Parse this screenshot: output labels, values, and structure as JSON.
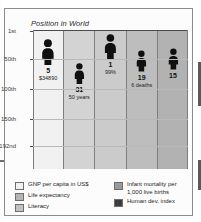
{
  "chart_data": {
    "type": "bar",
    "title": "Position in World",
    "xlabel": "",
    "ylabel": "",
    "ylim": [
      1,
      192
    ],
    "y_axis_inverted": true,
    "grid": true,
    "legend_position": "bottom",
    "y_ticks": [
      {
        "label": "1st",
        "value": 1
      },
      {
        "label": "50th",
        "value": 50
      },
      {
        "label": "100th",
        "value": 100
      },
      {
        "label": "150th",
        "value": 150
      },
      {
        "label": "192nd",
        "value": 192
      }
    ],
    "categories": [
      "GNP per capita in US$",
      "Life expectancy",
      "Literacy",
      "Infant mortality per 1,000 live births",
      "Human dev. index"
    ],
    "values": [
      5,
      31,
      1,
      19,
      15
    ],
    "annotations": [
      "$34890",
      "50 years",
      "99%",
      "6 deaths",
      ""
    ]
  },
  "chart": {
    "title": "Position in World",
    "yticks": [
      {
        "label": "1st",
        "top_px": 22
      },
      {
        "label": "50th",
        "top_px": 50
      },
      {
        "label": "100th",
        "top_px": 80
      },
      {
        "label": "150th",
        "top_px": 110
      },
      {
        "label": "192nd",
        "top_px": 137
      }
    ],
    "columns": [
      {
        "name": "gnp-per-capita",
        "rank": "5",
        "sublabel": "$34890",
        "fill": "#f1f1f1",
        "marker_top_px": 9,
        "person_height_px": 26,
        "person_color": "#101010"
      },
      {
        "name": "life-expectancy",
        "rank": "31",
        "sublabel": "50\nyears",
        "fill": "#d3d3d3",
        "marker_top_px": 33,
        "person_height_px": 21,
        "person_color": "#101010"
      },
      {
        "name": "literacy",
        "rank": "1",
        "sublabel": "99%",
        "fill": "#cbcbcb",
        "marker_top_px": 4,
        "person_height_px": 25,
        "person_color": "#101010"
      },
      {
        "name": "infant-mortality",
        "rank": "19",
        "sublabel": "6\ndeaths",
        "fill": "#bdbdbd",
        "marker_top_px": 20,
        "person_height_px": 22,
        "person_color": "#101010"
      },
      {
        "name": "human-dev-index",
        "rank": "15",
        "sublabel": "",
        "fill": "#b2b2b2",
        "marker_top_px": 18,
        "person_height_px": 22,
        "person_color": "#101010"
      }
    ]
  },
  "legend": {
    "left_items": [
      {
        "label": "GNP per capita in US$",
        "color": "#f1f1f1"
      },
      {
        "label": "Life expectancy",
        "color": "#b5b5b5"
      },
      {
        "label": "Literacy",
        "color": "#c2c2c2"
      }
    ],
    "right_items": [
      {
        "label": "Infant mortality per\n1,000 live births",
        "color": "#9a9a9a"
      },
      {
        "label": "Human dev. index",
        "color": "#3c3c3c"
      }
    ]
  }
}
